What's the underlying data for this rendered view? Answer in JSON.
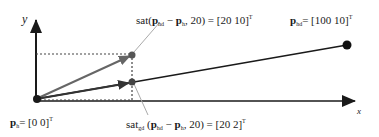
{
  "diagram": {
    "axes": {
      "x_label": "x",
      "y_label": "y"
    },
    "points": {
      "origin": {
        "name": "p",
        "sub": "h",
        "value": "= [0   0]",
        "sup": "T"
      },
      "target": {
        "name": "p",
        "sub": "hd",
        "value": "= [100   10]",
        "sup": "T"
      },
      "sat": {
        "prefix": "sat",
        "paren_open": "(",
        "p1": "p",
        "p1_sub": "hd",
        "minus": " − ",
        "p2": "p",
        "p2_sub": "h",
        "rest": ", 20) = [20   10]",
        "sup": "T"
      },
      "sat_gd": {
        "prefix": "sat",
        "prefix_sub": "gd",
        "paren_open": " (",
        "p1": "p",
        "p1_sub": "hd",
        "minus": " − ",
        "p2": "p",
        "p2_sub": "h",
        "rest": ", 20) = [20   2]",
        "sup": "T"
      }
    },
    "colors": {
      "dark": "#1a1a1a",
      "gray": "#777777",
      "light_gray": "#aaaaaa"
    }
  }
}
